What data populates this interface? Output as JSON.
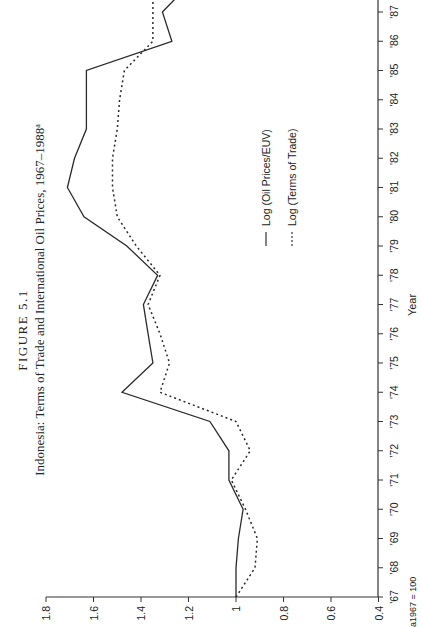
{
  "figure": {
    "label": "FIGURE 5.1",
    "title": "Indonesia: Terms of Trade and International Oil Prices, 1967–1988",
    "title_footnote_mark": "a",
    "footnote": "a1967 = 100"
  },
  "chart_data": {
    "type": "line",
    "title": "Indonesia: Terms of Trade and International Oil Prices, 1967–1988",
    "xlabel": "Year",
    "ylabel": "",
    "orientation_note": "page rotated 90° counter-clockwise; year axis runs bottom-to-top on right, value axis runs right-to-left along bottom",
    "x": [
      1967,
      1968,
      1969,
      1970,
      1971,
      1972,
      1973,
      1974,
      1975,
      1976,
      1977,
      1978,
      1979,
      1980,
      1981,
      1982,
      1983,
      1984,
      1985,
      1986,
      1987,
      1988
    ],
    "x_tick_labels": [
      "'67",
      "'68",
      "'69",
      "'70",
      "'71",
      "'72",
      "'73",
      "'74",
      "'75",
      "'76",
      "'77",
      "'78",
      "'79",
      "'80",
      "'81",
      "'82",
      "'83",
      "'84",
      "'85",
      "'86",
      "'87"
    ],
    "ylim": [
      0.4,
      1.8
    ],
    "y_ticks": [
      1.8,
      1.6,
      1.4,
      1.2,
      1,
      0.8,
      0.6,
      0.4
    ],
    "y_tick_labels": [
      "1.8",
      "1.6",
      "1.4",
      "1.2",
      "1",
      "0.8",
      "0.6",
      "0.4"
    ],
    "grid": false,
    "legend_position": "inside, center-right",
    "series": [
      {
        "name": "Log (Oil Prices/EUV)",
        "style": "solid",
        "values": [
          1.0,
          1.0,
          0.99,
          0.97,
          1.03,
          1.03,
          1.11,
          1.48,
          1.35,
          1.37,
          1.39,
          1.33,
          1.46,
          1.64,
          1.71,
          1.68,
          1.63,
          1.63,
          1.63,
          1.27,
          1.31,
          1.19
        ]
      },
      {
        "name": "Log (Terms of Trade)",
        "style": "dotted",
        "values": [
          1.0,
          0.92,
          0.91,
          0.96,
          1.02,
          0.94,
          1.0,
          1.32,
          1.28,
          1.32,
          1.37,
          1.32,
          1.42,
          1.5,
          1.52,
          1.52,
          1.5,
          1.49,
          1.47,
          1.35,
          1.35,
          1.35
        ]
      }
    ]
  }
}
